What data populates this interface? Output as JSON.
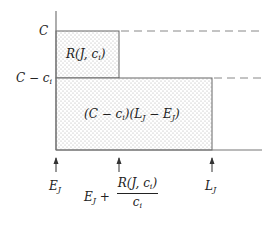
{
  "diagram": {
    "type": "resource-time-area-diagram",
    "y_axis_labels": {
      "top": "C",
      "middle_base": "C − c",
      "middle_sub": "i"
    },
    "x_axis_labels": {
      "left_base": "E",
      "left_sub": "J",
      "middle_prefix_base": "E",
      "middle_prefix_sub": "J",
      "middle_plus": " + ",
      "middle_num": "R(J, c",
      "middle_num_sub": "i",
      "middle_num_close": ")",
      "middle_den_base": "c",
      "middle_den_sub": "i",
      "right_base": "L",
      "right_sub": "J"
    },
    "regions": {
      "small_rect_label": "R(J, c",
      "small_rect_sub": "i",
      "small_rect_close": ")",
      "large_rect_label_1": "(C − c",
      "large_rect_sub_1": "i",
      "large_rect_label_2": ")(L",
      "large_rect_sub_2": "J",
      "large_rect_label_3": " − E",
      "large_rect_sub_3": "J",
      "large_rect_label_4": ")"
    },
    "colors": {
      "axis": "#777777",
      "rect_border": "#666666",
      "fill_dots": "#aaaaaa",
      "dashed": "#888888",
      "text": "#222222"
    }
  }
}
